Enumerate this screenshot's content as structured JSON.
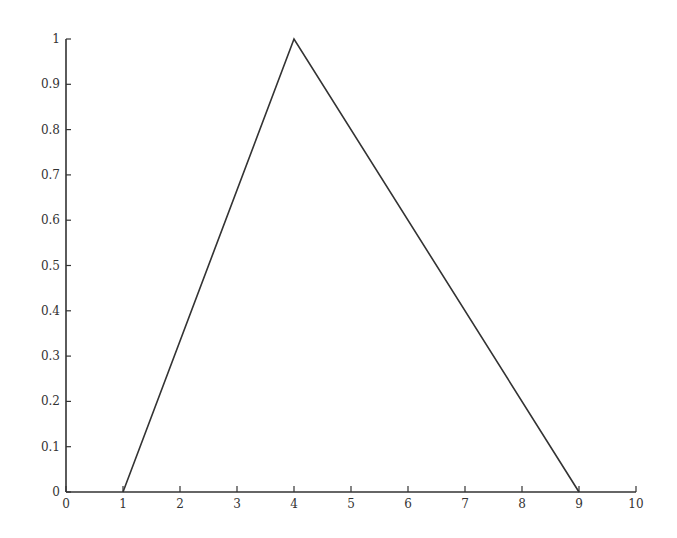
{
  "chart_data": {
    "type": "line",
    "title": "",
    "xlabel": "",
    "ylabel": "",
    "xlim": [
      0,
      10
    ],
    "ylim": [
      0,
      1
    ],
    "grid": false,
    "legend": null,
    "x_ticks": [
      "0",
      "1",
      "2",
      "3",
      "4",
      "5",
      "6",
      "7",
      "8",
      "9",
      "10"
    ],
    "y_ticks": [
      "0",
      "0.1",
      "0.2",
      "0.3",
      "0.4",
      "0.5",
      "0.6",
      "0.7",
      "0.8",
      "0.9",
      "1"
    ],
    "series": [
      {
        "name": "triangular membership function",
        "x": [
          1,
          4,
          9
        ],
        "y": [
          0,
          1,
          0
        ],
        "color": "#333333"
      }
    ]
  }
}
